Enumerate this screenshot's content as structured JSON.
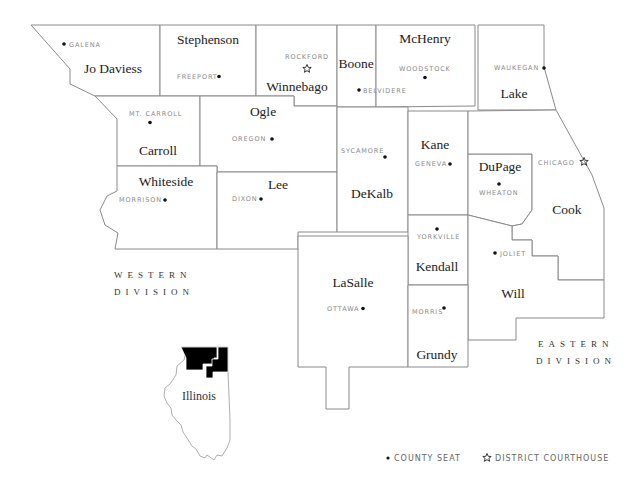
{
  "map": {
    "title": "Northern Illinois District Courts",
    "counties": [
      {
        "name": "Jo Daviess",
        "seat": "GALENA",
        "seat_type": "county-seat"
      },
      {
        "name": "Stephenson",
        "seat": "FREEPORT",
        "seat_type": "county-seat"
      },
      {
        "name": "Winnebago",
        "seat": "ROCKFORD",
        "seat_type": "district-courthouse"
      },
      {
        "name": "Boone",
        "seat": "BELVIDERE",
        "seat_type": "county-seat"
      },
      {
        "name": "McHenry",
        "seat": "WOODSTOCK",
        "seat_type": "county-seat"
      },
      {
        "name": "Lake",
        "seat": "WAUKEGAN",
        "seat_type": "county-seat"
      },
      {
        "name": "Carroll",
        "seat": "MT. CARROLL",
        "seat_type": "county-seat"
      },
      {
        "name": "Ogle",
        "seat": "OREGON",
        "seat_type": "county-seat"
      },
      {
        "name": "Whiteside",
        "seat": "MORRISON",
        "seat_type": "county-seat"
      },
      {
        "name": "Lee",
        "seat": "DIXON",
        "seat_type": "county-seat"
      },
      {
        "name": "DeKalb",
        "seat": "SYCAMORE",
        "seat_type": "county-seat"
      },
      {
        "name": "Kane",
        "seat": "GENEVA",
        "seat_type": "county-seat"
      },
      {
        "name": "DuPage",
        "seat": "WHEATON",
        "seat_type": "county-seat"
      },
      {
        "name": "Cook",
        "seat": "CHICAGO",
        "seat_type": "district-courthouse"
      },
      {
        "name": "Kendall",
        "seat": "YORKVILLE",
        "seat_type": "county-seat"
      },
      {
        "name": "Will",
        "seat": "JOLIET",
        "seat_type": "county-seat"
      },
      {
        "name": "LaSalle",
        "seat": "OTTAWA",
        "seat_type": "county-seat"
      },
      {
        "name": "Grundy",
        "seat": "MORRIS",
        "seat_type": "county-seat"
      }
    ],
    "divisions": {
      "western": {
        "line1": "WESTERN",
        "line2": "DIVISION"
      },
      "eastern": {
        "line1": "EASTERN",
        "line2": "DIVISION"
      }
    },
    "inset": {
      "state_name": "Illinois",
      "highlight_color": "#000000"
    },
    "legend": {
      "county_seat_label": "COUNTY SEAT",
      "courthouse_label": "DISTRICT COURTHOUSE",
      "county_seat_icon": "dot-icon",
      "courthouse_icon": "star-icon"
    },
    "colors": {
      "border": "#8a8a8a",
      "county_name": "#222222",
      "seat_text": "#8a8a8a",
      "background": "#ffffff"
    }
  }
}
